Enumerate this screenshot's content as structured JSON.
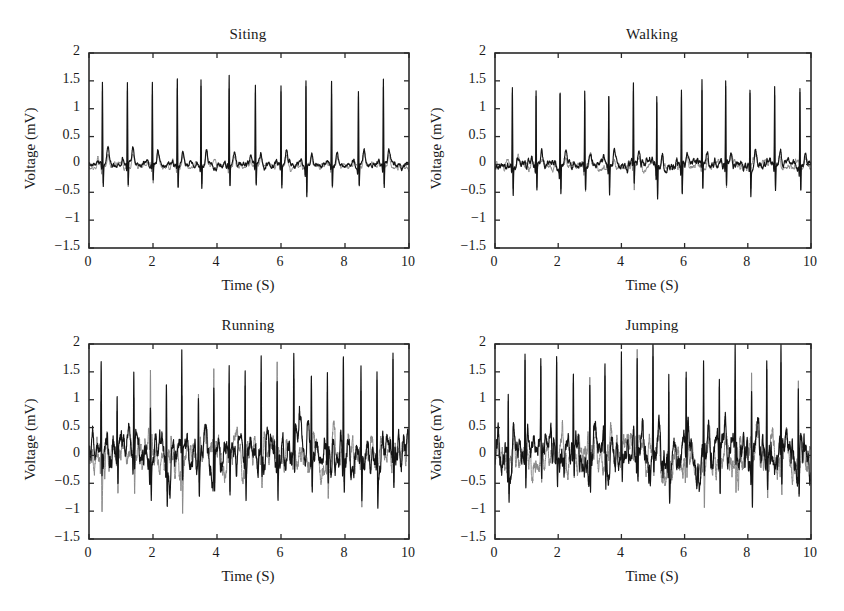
{
  "figure": {
    "width": 844,
    "height": 611,
    "background": "#ffffff",
    "layout": "2x2 grid of subplots",
    "trace_colors": {
      "primary": "#141414",
      "secondary": "#8a8a8a"
    }
  },
  "chart_data": [
    {
      "type": "line",
      "title": "Siting",
      "xlabel": "Time (S)",
      "ylabel": "Voltage (mV)",
      "xlim": [
        0,
        10
      ],
      "ylim": [
        -1.5,
        2
      ],
      "xticks": [
        0,
        2,
        4,
        6,
        8,
        10
      ],
      "yticks": [
        -1.5,
        -1,
        -0.5,
        0,
        0.5,
        1,
        1.5,
        2
      ],
      "xticklabels": [
        "0",
        "2",
        "4",
        "6",
        "8",
        "10"
      ],
      "yticklabels": [
        "−1.5",
        "−1",
        "−0.5",
        "0",
        "0.5",
        "1",
        "1.5",
        "2"
      ],
      "grid": false,
      "legend": "none",
      "signal_description": "ECG waveform, regular rhythm, low baseline noise",
      "series": [
        {
          "name": "measured-ecg",
          "color": "#141414",
          "beat_times": [
            0.42,
            1.2,
            1.98,
            2.76,
            3.5,
            4.38,
            5.2,
            6.0,
            6.78,
            7.58,
            8.42,
            9.2
          ],
          "r_peak_amplitudes": [
            1.5,
            1.47,
            1.45,
            1.55,
            1.57,
            1.55,
            1.43,
            1.41,
            1.57,
            1.48,
            1.37,
            1.52
          ],
          "s_trough_amplitudes": [
            -0.38,
            -0.43,
            -0.36,
            -0.42,
            -0.4,
            -0.41,
            -0.39,
            -0.44,
            -0.55,
            -0.4,
            -0.35,
            -0.42
          ],
          "t_wave_amplitude": 0.24,
          "baseline": 0.0,
          "noise_amplitude": 0.035
        },
        {
          "name": "reference-ecg",
          "color": "#8a8a8a",
          "beat_times": [
            0.42,
            1.2,
            1.98,
            2.76,
            3.5,
            4.38,
            5.2,
            6.0,
            6.78,
            7.58,
            8.42,
            9.2
          ],
          "r_peak_amplitudes": [
            1.38,
            1.35,
            1.33,
            1.43,
            1.45,
            1.43,
            1.31,
            1.29,
            1.45,
            1.36,
            1.26,
            1.4
          ],
          "s_trough_amplitudes": [
            -0.34,
            -0.39,
            -0.32,
            -0.38,
            -0.36,
            -0.37,
            -0.35,
            -0.4,
            -0.5,
            -0.36,
            -0.31,
            -0.38
          ],
          "t_wave_amplitude": 0.21,
          "baseline": -0.03,
          "noise_amplitude": 0.03
        }
      ]
    },
    {
      "type": "line",
      "title": "Walking",
      "xlabel": "Time (S)",
      "ylabel": "Voltage (mV)",
      "xlim": [
        0,
        10
      ],
      "ylim": [
        -1.5,
        2
      ],
      "xticks": [
        0,
        2,
        4,
        6,
        8,
        10
      ],
      "yticks": [
        -1.5,
        -1,
        -0.5,
        0,
        0.5,
        1,
        1.5,
        2
      ],
      "xticklabels": [
        "0",
        "2",
        "4",
        "6",
        "8",
        "10"
      ],
      "yticklabels": [
        "−1.5",
        "−1",
        "−0.5",
        "0",
        "0.5",
        "1",
        "1.5",
        "2"
      ],
      "grid": false,
      "legend": "none",
      "signal_description": "ECG waveform, regular rhythm, slight motion artifact near 9.3 s",
      "series": [
        {
          "name": "measured-ecg",
          "color": "#141414",
          "beat_times": [
            0.55,
            1.3,
            2.06,
            2.84,
            3.6,
            4.38,
            5.12,
            5.9,
            6.55,
            7.3,
            8.07,
            8.85,
            9.65
          ],
          "r_peak_amplitudes": [
            1.36,
            1.41,
            1.44,
            1.38,
            1.3,
            1.42,
            1.32,
            1.4,
            1.47,
            1.44,
            1.42,
            1.36,
            1.39
          ],
          "s_trough_amplitudes": [
            -0.5,
            -0.43,
            -0.45,
            -0.44,
            -0.5,
            -0.45,
            -0.55,
            -0.5,
            -0.44,
            -0.45,
            -0.47,
            -0.46,
            -0.48
          ],
          "t_wave_amplitude": 0.2,
          "baseline": 0.0,
          "noise_amplitude": 0.05
        },
        {
          "name": "reference-ecg",
          "color": "#8a8a8a",
          "beat_times": [
            0.55,
            1.3,
            2.06,
            2.84,
            3.6,
            4.38,
            5.12,
            5.9,
            6.55,
            7.3,
            8.07,
            8.85,
            9.65
          ],
          "r_peak_amplitudes": [
            1.25,
            1.3,
            1.33,
            1.27,
            1.2,
            1.31,
            1.21,
            1.29,
            1.35,
            1.33,
            1.31,
            1.25,
            1.28
          ],
          "s_trough_amplitudes": [
            -0.45,
            -0.39,
            -0.41,
            -0.4,
            -0.45,
            -0.41,
            -0.5,
            -0.45,
            -0.4,
            -0.41,
            -0.43,
            -0.42,
            -0.44
          ],
          "t_wave_amplitude": 0.18,
          "baseline": -0.03,
          "noise_amplitude": 0.045
        }
      ]
    },
    {
      "type": "line",
      "title": "Running",
      "xlabel": "Time (S)",
      "ylabel": "Voltage (mV)",
      "xlim": [
        0,
        10
      ],
      "ylim": [
        -1.5,
        2
      ],
      "xticks": [
        0,
        2,
        4,
        6,
        8,
        10
      ],
      "yticks": [
        -1.5,
        -1,
        -0.5,
        0,
        0.5,
        1,
        1.5,
        2
      ],
      "xticklabels": [
        "0",
        "2",
        "4",
        "6",
        "8",
        "10"
      ],
      "yticklabels": [
        "−1.5",
        "−1",
        "−0.5",
        "0",
        "0.5",
        "1",
        "1.5",
        "2"
      ],
      "grid": false,
      "legend": "none",
      "signal_description": "ECG waveform, fast rhythm, heavy motion artifact baseline",
      "series": [
        {
          "name": "measured-ecg",
          "color": "#141414",
          "beat_times": [
            0.38,
            0.88,
            1.4,
            1.92,
            2.42,
            2.9,
            3.42,
            3.9,
            4.38,
            4.88,
            5.38,
            5.88,
            6.4,
            6.95,
            7.45,
            7.95,
            8.5,
            9.0,
            9.5
          ],
          "r_peak_amplitudes": [
            1.35,
            1.15,
            1.3,
            1.26,
            1.52,
            1.58,
            1.2,
            1.43,
            1.4,
            1.55,
            1.74,
            1.52,
            1.64,
            1.64,
            1.57,
            1.86,
            1.4,
            1.55,
            1.75
          ],
          "s_trough_amplitudes": [
            -0.62,
            -0.55,
            -0.6,
            -0.72,
            -0.6,
            -0.7,
            -0.62,
            -0.75,
            -0.82,
            -0.55,
            -0.5,
            -0.6,
            -0.55,
            -0.62,
            -0.55,
            -0.6,
            -0.72,
            -0.66,
            -0.55
          ],
          "t_wave_amplitude": 0.3,
          "baseline": 0.0,
          "noise_amplitude": 0.18
        },
        {
          "name": "reference-ecg",
          "color": "#8a8a8a",
          "beat_times": [
            0.38,
            0.88,
            1.4,
            1.92,
            2.42,
            2.9,
            3.42,
            3.9,
            4.38,
            4.88,
            5.38,
            5.88,
            6.4,
            6.95,
            7.45,
            7.95,
            8.5,
            9.0,
            9.5
          ],
          "r_peak_amplitudes": [
            1.22,
            1.04,
            1.18,
            1.14,
            1.38,
            1.44,
            1.08,
            1.3,
            1.27,
            1.41,
            1.58,
            1.38,
            1.49,
            1.49,
            1.43,
            1.7,
            1.27,
            1.41,
            1.6
          ],
          "s_trough_amplitudes": [
            -0.56,
            -0.5,
            -0.54,
            -0.65,
            -0.54,
            -0.63,
            -0.56,
            -0.68,
            -0.74,
            -0.5,
            -0.45,
            -0.54,
            -0.5,
            -0.56,
            -0.5,
            -0.54,
            -0.65,
            -0.6,
            -0.5
          ],
          "t_wave_amplitude": 0.27,
          "baseline": -0.04,
          "noise_amplitude": 0.17
        }
      ]
    },
    {
      "type": "line",
      "title": "Jumping",
      "xlabel": "Time (S)",
      "ylabel": "Voltage (mV)",
      "xlim": [
        0,
        10
      ],
      "ylim": [
        -1.5,
        2
      ],
      "xticks": [
        0,
        2,
        4,
        6,
        8,
        10
      ],
      "yticks": [
        -1.5,
        -1,
        -0.5,
        0,
        0.5,
        1,
        1.5,
        2
      ],
      "xticklabels": [
        "0",
        "2",
        "4",
        "6",
        "8",
        "10"
      ],
      "yticklabels": [
        "−1.5",
        "−1",
        "−0.5",
        "0",
        "0.5",
        "1",
        "1.5",
        "2"
      ],
      "grid": false,
      "legend": "none",
      "signal_description": "ECG waveform, fast rhythm, largest motion artifact; tallest R peak clipped near 2 mV at 4.5 s",
      "series": [
        {
          "name": "measured-ecg",
          "color": "#141414",
          "beat_times": [
            0.42,
            0.95,
            1.45,
            1.95,
            2.48,
            3.0,
            3.48,
            4.0,
            4.5,
            5.0,
            5.5,
            6.05,
            6.6,
            7.1,
            7.6,
            8.12,
            8.6,
            9.05,
            9.6
          ],
          "r_peak_amplitudes": [
            1.35,
            1.67,
            1.6,
            1.68,
            1.5,
            1.56,
            1.62,
            1.52,
            1.97,
            1.78,
            1.42,
            1.5,
            1.4,
            1.5,
            1.53,
            1.52,
            1.6,
            1.7,
            1.45
          ],
          "s_trough_amplitudes": [
            -0.6,
            -0.7,
            -0.58,
            -0.65,
            -0.55,
            -0.6,
            -0.62,
            -0.55,
            -0.5,
            -0.62,
            -0.7,
            -0.6,
            -0.58,
            -0.75,
            -0.68,
            -0.7,
            -0.62,
            -0.72,
            -0.65
          ],
          "t_wave_amplitude": 0.32,
          "baseline": 0.0,
          "noise_amplitude": 0.2
        },
        {
          "name": "reference-ecg",
          "color": "#8a8a8a",
          "beat_times": [
            0.42,
            0.95,
            1.45,
            1.95,
            2.48,
            3.0,
            3.48,
            4.0,
            4.5,
            5.0,
            5.5,
            6.05,
            6.6,
            7.1,
            7.6,
            8.12,
            8.6,
            9.05,
            9.6
          ],
          "r_peak_amplitudes": [
            1.22,
            1.52,
            1.46,
            1.53,
            1.36,
            1.42,
            1.48,
            1.38,
            1.8,
            1.62,
            1.29,
            1.36,
            1.27,
            1.36,
            1.39,
            1.38,
            1.46,
            1.55,
            1.32
          ],
          "s_trough_amplitudes": [
            -0.54,
            -0.63,
            -0.52,
            -0.59,
            -0.5,
            -0.54,
            -0.56,
            -0.5,
            -0.45,
            -0.56,
            -0.63,
            -0.54,
            -0.52,
            -0.68,
            -0.61,
            -0.63,
            -0.56,
            -0.65,
            -0.59
          ],
          "t_wave_amplitude": 0.29,
          "baseline": -0.05,
          "noise_amplitude": 0.19
        }
      ]
    }
  ]
}
